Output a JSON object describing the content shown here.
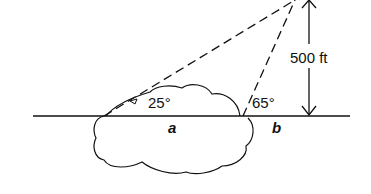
{
  "diagram": {
    "height_label": "500 ft",
    "angle_left": "25°",
    "angle_right": "65°",
    "segment_a": "a",
    "segment_b": "b",
    "colors": {
      "stroke": "#111111",
      "background": "#ffffff"
    }
  }
}
